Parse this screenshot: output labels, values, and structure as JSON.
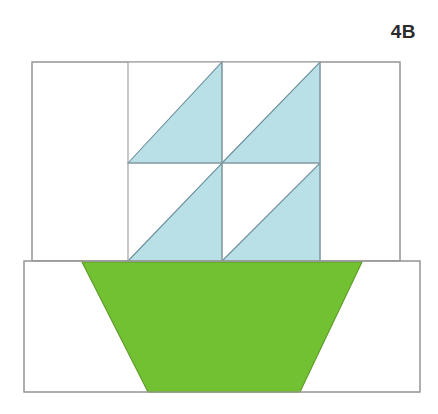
{
  "page": {
    "background_color": "#ffffff",
    "width": 438,
    "height": 414
  },
  "label": {
    "text": "4B",
    "color": "#2b2b2b",
    "position": "top-right"
  },
  "colors": {
    "sail_fill": "#b9dfe7",
    "hull_fill": "#72c132",
    "background_fill": "#ffffff",
    "outline_stroke": "#9a9a9a",
    "sail_outline_stroke": "#6c8f9c",
    "hull_outline_stroke": "#5d9a27",
    "label_color": "#2b2b2b"
  },
  "diagram": {
    "type": "quilt-block-sailboat",
    "name": "Sailboat block 4B",
    "upper_section": {
      "name": "sky-panel",
      "x": 32,
      "y": 62,
      "width": 368,
      "height": 199,
      "fill": "#ffffff"
    },
    "lower_section": {
      "name": "hull-panel",
      "x": 24,
      "y": 261,
      "width": 396,
      "height": 131,
      "fill": "#ffffff"
    },
    "sail_grid": {
      "name": "sail-grid",
      "left": 128,
      "top": 62,
      "right": 320,
      "bottom": 261,
      "mid_x": 222,
      "mid_y": 163,
      "rows": 2,
      "cols": 2,
      "units": [
        {
          "name": "sail-unit-top-left",
          "row": 0,
          "col": 0,
          "orientation": "fill-upper-right"
        },
        {
          "name": "sail-unit-top-right",
          "row": 0,
          "col": 1,
          "orientation": "fill-lower-right"
        },
        {
          "name": "sail-unit-bottom-left",
          "row": 1,
          "col": 0,
          "orientation": "fill-lower-right"
        },
        {
          "name": "sail-unit-bottom-right",
          "row": 1,
          "col": 1,
          "orientation": "fill-lower-right"
        }
      ]
    },
    "hull": {
      "name": "hull-trapezoid",
      "points": "82,262 362,262 300,392 148,392",
      "fill": "#72c132"
    },
    "grid_lines": [
      {
        "name": "sail-grid-line-vertical-left",
        "x1": 128,
        "y1": 62,
        "x2": 128,
        "y2": 261
      },
      {
        "name": "sail-grid-line-vertical-center",
        "x1": 222,
        "y1": 62,
        "x2": 222,
        "y2": 261
      },
      {
        "name": "sail-grid-line-vertical-right",
        "x1": 320,
        "y1": 62,
        "x2": 320,
        "y2": 261
      },
      {
        "name": "sail-grid-line-horizontal-mid",
        "x1": 128,
        "y1": 163,
        "x2": 320,
        "y2": 163
      }
    ]
  }
}
